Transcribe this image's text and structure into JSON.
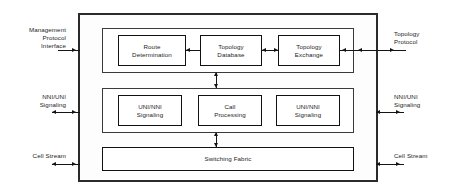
{
  "diagram": {
    "chassis_label": "",
    "groups": [
      {
        "name": "routing-plane",
        "units": [
          {
            "name": "route-determination",
            "label": "Route\nDetermination"
          },
          {
            "name": "topology-database",
            "label": "Topology\nDatabase"
          },
          {
            "name": "topology-exchange",
            "label": "Topology\nExchange"
          }
        ]
      },
      {
        "name": "signaling-plane",
        "units": [
          {
            "name": "uni-nni-signaling-left",
            "label": "UNI/NNI\nSignaling"
          },
          {
            "name": "call-processing",
            "label": "Call\nProcessing"
          },
          {
            "name": "uni-nni-signaling-right",
            "label": "UNI/NNI\nSignaling"
          }
        ]
      },
      {
        "name": "switching-plane",
        "units": [
          {
            "name": "switching-fabric",
            "label": "Switching Fabric"
          }
        ]
      }
    ],
    "external_interfaces": {
      "left": [
        {
          "name": "management-protocol-interface",
          "label": "Management\nProtocol\nInterface",
          "arrow": "right"
        },
        {
          "name": "nni-uni-signaling-left",
          "label": "NNI/UNI\nSignaling",
          "arrow": "both"
        },
        {
          "name": "cell-stream-left",
          "label": "Cell Stream",
          "arrow": "both"
        }
      ],
      "right": [
        {
          "name": "topology-protocol",
          "label": "Topology\nProtocol",
          "arrow": "both"
        },
        {
          "name": "nni-uni-signaling-right",
          "label": "NNI/UNI\nSignaling",
          "arrow": "both"
        },
        {
          "name": "cell-stream-right",
          "label": "Cell Stream",
          "arrow": "both"
        }
      ]
    },
    "internal_connectors": [
      {
        "name": "route-to-topology-db-arrow",
        "direction": "left"
      },
      {
        "name": "topology-db-to-exchange-arrow",
        "direction": "both"
      },
      {
        "name": "routing-to-signaling-arrow",
        "direction": "both"
      },
      {
        "name": "signaling-to-switching-arrow",
        "direction": "both"
      }
    ],
    "colors": {
      "line": "#141414",
      "chassis_border": "#2b2b2b",
      "text": "#1d1d1d",
      "background": "#ffffff"
    }
  }
}
